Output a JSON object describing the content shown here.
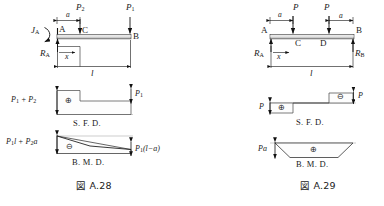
{
  "figures": [
    {
      "id": "A.28",
      "caption": "図 A.28",
      "beam": {
        "type": "cantilever-fixed-left",
        "left_node": "A",
        "right_node": "B",
        "mid_node": "C",
        "fixing_moment": "J",
        "fixing_moment_sub": "A",
        "reaction": "R",
        "reaction_sub": "A",
        "loads": [
          {
            "label": "P",
            "sub": "2",
            "at": "C"
          },
          {
            "label": "P",
            "sub": "1",
            "at": "B"
          }
        ],
        "dimensions": [
          {
            "label": "a",
            "from": "A",
            "to": "C"
          },
          {
            "label": "x",
            "from": "A",
            "to": "section"
          },
          {
            "label": "l",
            "from": "A",
            "to": "B"
          }
        ]
      },
      "sfd": {
        "name": "S. F. D.",
        "sign": "⊕",
        "left_value": "P₁ + P₂",
        "left_value_parts": [
          "P",
          "1",
          "+",
          "P",
          "2"
        ],
        "right_value": "P₁",
        "right_value_parts": [
          "P",
          "1"
        ]
      },
      "bmd": {
        "name": "B. M. D.",
        "sign": "⊖",
        "left_value": "P₁l + P₂a",
        "right_value": "P₁(l − a)"
      }
    },
    {
      "id": "A.29",
      "caption": "図 A.29",
      "beam": {
        "type": "simply-supported",
        "left_node": "A",
        "right_node": "B",
        "inner_nodes": [
          "C",
          "D"
        ],
        "reactions": [
          {
            "label": "R",
            "sub": "A"
          },
          {
            "label": "R",
            "sub": "B"
          }
        ],
        "loads": [
          {
            "label": "P",
            "at": "C"
          },
          {
            "label": "P",
            "at": "D"
          }
        ],
        "dimensions": [
          {
            "label": "a",
            "from": "A",
            "to": "C"
          },
          {
            "label": "a",
            "from": "D",
            "to": "B"
          },
          {
            "label": "x",
            "from": "A",
            "to": "section"
          },
          {
            "label": "l",
            "from": "A",
            "to": "B"
          }
        ]
      },
      "sfd": {
        "name": "S. F. D.",
        "positive_sign": "⊕",
        "negative_sign": "⊖",
        "left_value": "P",
        "right_value": "P"
      },
      "bmd": {
        "name": "B. M. D.",
        "sign": "⊕",
        "value": "Pa"
      }
    }
  ]
}
